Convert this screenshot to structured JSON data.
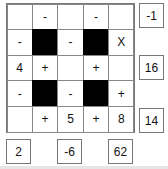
{
  "grid": {
    "rows": [
      [
        {
          "v": ""
        },
        {
          "v": "-"
        },
        {
          "v": ""
        },
        {
          "v": "-"
        },
        {
          "v": ""
        }
      ],
      [
        {
          "v": "-"
        },
        {
          "black": true
        },
        {
          "v": "-"
        },
        {
          "black": true
        },
        {
          "v": "X"
        }
      ],
      [
        {
          "v": "4"
        },
        {
          "v": "+"
        },
        {
          "v": ""
        },
        {
          "v": "+"
        },
        {
          "v": ""
        }
      ],
      [
        {
          "v": "-"
        },
        {
          "black": true
        },
        {
          "v": "-"
        },
        {
          "black": true
        },
        {
          "v": "+"
        }
      ],
      [
        {
          "v": ""
        },
        {
          "v": "+"
        },
        {
          "v": "5"
        },
        {
          "v": "+"
        },
        {
          "v": "8"
        }
      ]
    ]
  },
  "row_results": [
    {
      "row": 0,
      "value": "-1"
    },
    {
      "row": 2,
      "value": "16"
    },
    {
      "row": 4,
      "value": "14"
    }
  ],
  "col_results": [
    {
      "col": 0,
      "value": "2"
    },
    {
      "col": 2,
      "value": "-6"
    },
    {
      "col": 4,
      "value": "62"
    }
  ]
}
